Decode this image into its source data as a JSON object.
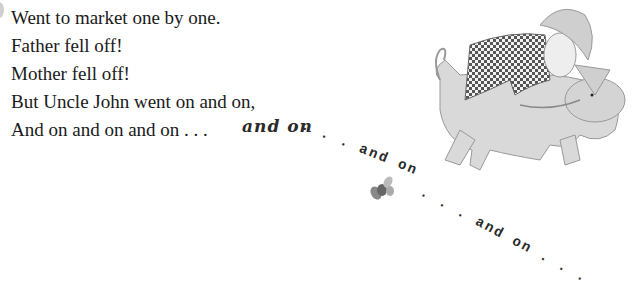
{
  "verse": {
    "lines": [
      "Went to market one by one.",
      "Father fell off!",
      "Mother fell off!",
      "But Uncle John went on and on,",
      "And on and on and on . . ."
    ]
  },
  "trail": [
    {
      "text": "and on",
      "style": "bold-serif"
    },
    {
      "text": ". . . and on",
      "style": "typewriter"
    },
    {
      "text": ". . . and on . . .",
      "style": "typewriter"
    }
  ],
  "illustration": {
    "subject": "boy in checkered shirt and hat riding a pig",
    "colors": {
      "pig": "#d9d9d9",
      "shirt": "#555555",
      "hat": "#cfcfcf"
    }
  }
}
